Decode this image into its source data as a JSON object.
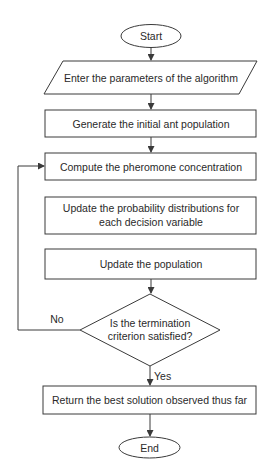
{
  "diagram": {
    "type": "flowchart",
    "colors": {
      "stroke": "#3a3a3a",
      "text": "#2a2a2a",
      "background": "#ffffff"
    },
    "nodes": [
      {
        "id": "start",
        "shape": "terminator",
        "label": "Start"
      },
      {
        "id": "enter_params",
        "shape": "input-output",
        "label": "Enter the parameters of the algorithm"
      },
      {
        "id": "generate",
        "shape": "process",
        "label": "Generate the initial ant population"
      },
      {
        "id": "compute",
        "shape": "process",
        "label": "Compute the pheromone concentration"
      },
      {
        "id": "update_prob",
        "shape": "process",
        "label_line1": "Update the probability distributions for",
        "label_line2": "each decision variable"
      },
      {
        "id": "update_pop",
        "shape": "process",
        "label": "Update the population"
      },
      {
        "id": "decision",
        "shape": "decision",
        "label_line1": "Is the termination",
        "label_line2": "criterion satisfied?"
      },
      {
        "id": "return_best",
        "shape": "process",
        "label": "Return the best solution observed thus far"
      },
      {
        "id": "end",
        "shape": "terminator",
        "label": "End"
      }
    ],
    "edges": [
      {
        "from": "start",
        "to": "enter_params"
      },
      {
        "from": "enter_params",
        "to": "generate"
      },
      {
        "from": "generate",
        "to": "compute"
      },
      {
        "from": "update_pop",
        "to": "decision"
      },
      {
        "from": "decision",
        "to": "compute",
        "label": "No"
      },
      {
        "from": "decision",
        "to": "return_best",
        "label": "Yes"
      },
      {
        "from": "return_best",
        "to": "end"
      }
    ],
    "edge_labels": {
      "no": "No",
      "yes": "Yes"
    }
  }
}
